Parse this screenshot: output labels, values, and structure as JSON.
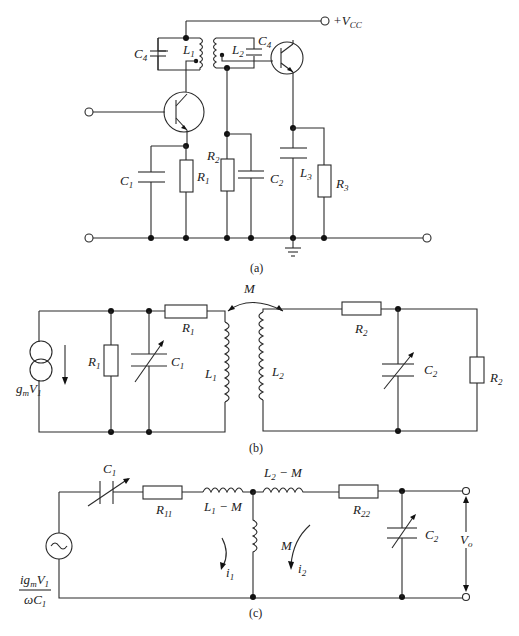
{
  "figure": {
    "panels": [
      {
        "id": "a",
        "caption": "(a)",
        "labels": {
          "vcc": "+V",
          "vcc_sub": "CC",
          "c4_left": "C",
          "c4_left_sub": "4",
          "l1": "L",
          "l1_sub": "1",
          "l2": "L",
          "l2_sub": "2",
          "c4_right": "C",
          "c4_right_sub": "4",
          "c1": "C",
          "c1_sub": "1",
          "r1": "R",
          "r1_sub": "1",
          "r2": "R",
          "r2_sub": "2",
          "c2": "C",
          "c2_sub": "2",
          "l3": "L",
          "l3_sub": "3",
          "r3": "R",
          "r3_sub": "3"
        }
      },
      {
        "id": "b",
        "caption": "(b)",
        "labels": {
          "m": "M",
          "source": "g",
          "source_sub": "m",
          "source_v": "V",
          "source_v_sub": "1",
          "r1_shunt": "R",
          "r1_shunt_sub": "1",
          "c1": "C",
          "c1_sub": "1",
          "r1_series": "R",
          "r1_series_sub": "1",
          "l1": "L",
          "l1_sub": "1",
          "l2": "L",
          "l2_sub": "2",
          "r2_series": "R",
          "r2_series_sub": "2",
          "c2": "C",
          "c2_sub": "2",
          "r2_load": "R",
          "r2_load_sub": "2"
        }
      },
      {
        "id": "c",
        "caption": "(c)",
        "labels": {
          "c1": "C",
          "c1_sub": "1",
          "r11": "R",
          "r11_sub": "11",
          "l1m": "L",
          "l1m_sub": "1",
          "l1m_rest": " − M",
          "l2m": "L",
          "l2m_sub": "2",
          "l2m_rest": " − M",
          "m": "M",
          "r22": "R",
          "r22_sub": "22",
          "c2": "C",
          "c2_sub": "2",
          "vo": "V",
          "vo_sub": "o",
          "i1": "i",
          "i1_sub": "1",
          "i2": "i",
          "i2_sub": "2",
          "src_num": "ig",
          "src_num_sub": "m",
          "src_num_v": "V",
          "src_num_v_sub": "1",
          "src_den": "ωC",
          "src_den_sub": "1"
        }
      }
    ]
  }
}
